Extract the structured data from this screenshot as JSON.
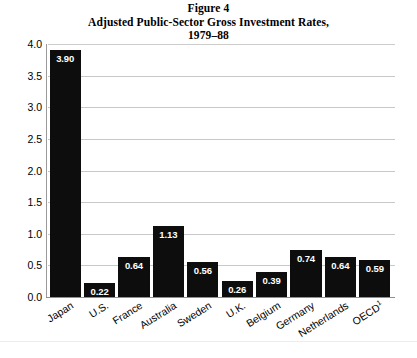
{
  "chart_data": {
    "type": "bar",
    "title": "Figure 4",
    "subtitle": "Adjusted Public-Sector Gross Investment Rates,",
    "subtitle2": "1979–88",
    "title_lines": [
      "Figure 4",
      "Adjusted Public-Sector Gross Investment Rates,",
      "1979–88"
    ],
    "categories": [
      "Japan",
      "U.S.",
      "France",
      "Australia",
      "Sweden",
      "U.K.",
      "Belgium",
      "Germany",
      "Netherlands",
      "OECD"
    ],
    "category_footnotes": [
      "",
      "",
      "",
      "",
      "",
      "",
      "",
      "",
      "",
      "1"
    ],
    "values": [
      3.9,
      0.22,
      0.64,
      1.13,
      0.56,
      0.26,
      0.39,
      0.74,
      0.64,
      0.59
    ],
    "value_labels": [
      "3.90",
      "0.22",
      "0.64",
      "1.13",
      "0.56",
      "0.26",
      "0.39",
      "0.74",
      "0.64",
      "0.59"
    ],
    "xlabel": "",
    "ylabel": "",
    "ylim": [
      0.0,
      4.0
    ],
    "yticks": [
      0.0,
      0.5,
      1.0,
      1.5,
      2.0,
      2.5,
      3.0,
      3.5,
      4.0
    ],
    "ytick_labels": [
      "0.0",
      "0.5",
      "1.0",
      "1.5",
      "2.0",
      "2.5",
      "3.0",
      "3.5",
      "4.0"
    ],
    "grid": "horizontal",
    "legend": "none",
    "bar_color": "#0d0d0d",
    "grid_color": "#c8c8c8",
    "value_label_color": "#ffffff"
  }
}
